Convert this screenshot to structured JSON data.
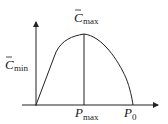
{
  "diagram": {
    "type": "concave curve with peak",
    "labels": {
      "c_max": {
        "base": "C",
        "bar": true,
        "sub": "max"
      },
      "c_min": {
        "base": "C",
        "bar": true,
        "sub": "min"
      },
      "p_max": {
        "base": "P",
        "sub": "max"
      },
      "p_zero": {
        "base": "P",
        "sub": "0"
      }
    },
    "colors": {
      "line": "#222222",
      "background": "#ffffff"
    }
  }
}
